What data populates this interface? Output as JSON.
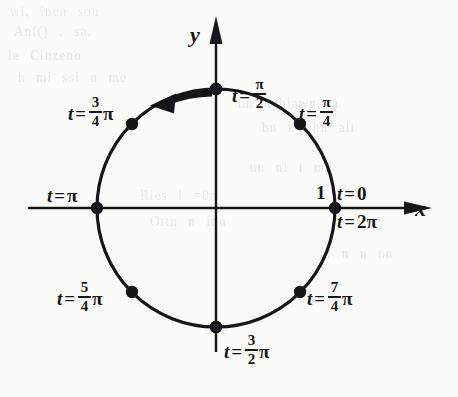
{
  "figure": {
    "kind": "unit-circle-parametrization",
    "background_color": "#fbfbf9",
    "ink_color": "#15161a",
    "axes": {
      "x_label": "x",
      "y_label": "y",
      "origin_px": [
        216,
        208
      ]
    },
    "circle": {
      "center_px": [
        216,
        208
      ],
      "radius_px": 119,
      "radius_label": "1",
      "stroke_width": 3
    },
    "direction_arrow": {
      "sense": "counterclockwise",
      "from_t": "π/2",
      "to_t": "3π/4"
    }
  },
  "labels": {
    "t_var": "t",
    "equals": "=",
    "pi": "π",
    "radius_one": "1",
    "axis_x": "x",
    "axis_y": "y"
  },
  "points": [
    {
      "name": "t-0",
      "t_text": "t = 0",
      "angle_deg": 0,
      "whole": "0",
      "numerator": "",
      "denominator": "",
      "has_pi": false
    },
    {
      "name": "t-2pi",
      "t_text": "t = 2π",
      "angle_deg": 0,
      "whole": "2",
      "numerator": "",
      "denominator": "",
      "has_pi": true
    },
    {
      "name": "t-pi-4",
      "t_text": "t = π/4",
      "angle_deg": 45,
      "whole": "",
      "numerator": "π",
      "denominator": "4",
      "has_pi": false
    },
    {
      "name": "t-pi-2",
      "t_text": "t = π/2",
      "angle_deg": 90,
      "whole": "",
      "numerator": "π",
      "denominator": "2",
      "has_pi": false
    },
    {
      "name": "t-3pi-4",
      "t_text": "t = 3/4 π",
      "angle_deg": 135,
      "whole": "",
      "numerator": "3",
      "denominator": "4",
      "has_pi": true
    },
    {
      "name": "t-pi",
      "t_text": "t = π",
      "angle_deg": 180,
      "whole": "",
      "numerator": "",
      "denominator": "",
      "has_pi": true
    },
    {
      "name": "t-5pi-4",
      "t_text": "t = 5/4 π",
      "angle_deg": 225,
      "whole": "",
      "numerator": "5",
      "denominator": "4",
      "has_pi": true
    },
    {
      "name": "t-3pi-2",
      "t_text": "t = 3/2 π",
      "angle_deg": 270,
      "whole": "",
      "numerator": "3",
      "denominator": "2",
      "has_pi": true
    },
    {
      "name": "t-7pi-4",
      "t_text": "t = 7/4 π",
      "angle_deg": 315,
      "whole": "",
      "numerator": "7",
      "denominator": "4",
      "has_pi": true
    }
  ],
  "ghost_text": {
    "note": "faint show-through from the reverse side of the page, illegible",
    "lines": [
      "wi, inen sou",
      "Anf() .  sa.",
      "le Cinzeno",
      "h  mi ssi  u me",
      "hn  nuhiawn. a",
      "bn  z  uhn  ali",
      "nn  ni  i  mn",
      "Ries  l =0n",
      "Ottn  n inn",
      "m  n  n  nn"
    ]
  }
}
